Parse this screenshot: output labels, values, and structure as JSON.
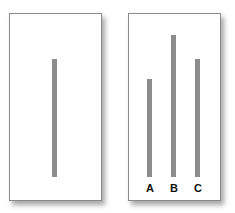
{
  "diagram": {
    "title": "",
    "line_color": "#8c8c8c",
    "reference_card": {
      "line": {
        "height_px": 118
      }
    },
    "comparison_card": {
      "lines": [
        {
          "label": "A",
          "height_px": 98
        },
        {
          "label": "B",
          "height_px": 142
        },
        {
          "label": "C",
          "height_px": 118
        }
      ]
    }
  }
}
